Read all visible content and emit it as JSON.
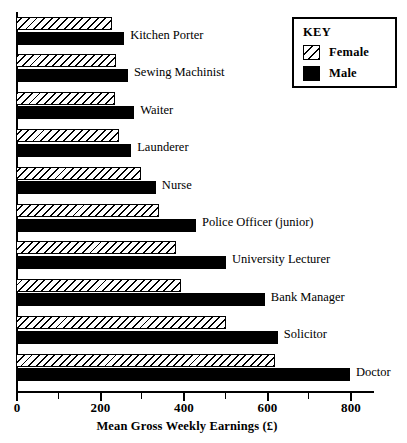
{
  "chart_data": {
    "type": "bar",
    "orientation": "horizontal",
    "title": "",
    "xlabel": "Mean Gross Weekly Earnings (£)",
    "ylabel": "",
    "xlim": [
      0,
      860
    ],
    "xticks": [
      0,
      200,
      400,
      600,
      800
    ],
    "xtick_labels": [
      "0",
      "200",
      "400",
      "600",
      "800"
    ],
    "minor_ticks": [
      100,
      300,
      500,
      700
    ],
    "grid": false,
    "legend_position": "top-right",
    "legend_title": "KEY",
    "categories": [
      "Kitchen Porter",
      "Sewing Machinist",
      "Waiter",
      "Launderer",
      "Nurse",
      "Police Officer (junior)",
      "University Lecturer",
      "Bank Manager",
      "Solicitor",
      "Doctor"
    ],
    "series": [
      {
        "name": "Female",
        "fill": "diagonal-hatch",
        "values": [
          230,
          240,
          237,
          247,
          300,
          343,
          383,
          395,
          503,
          620
        ]
      },
      {
        "name": "Male",
        "fill": "solid-black",
        "values": [
          259,
          268,
          283,
          276,
          335,
          431,
          503,
          596,
          627,
          800
        ]
      }
    ]
  },
  "legend": {
    "title": "KEY",
    "entries": [
      {
        "label": "Female",
        "swatch": "diagonal-hatch-swatch"
      },
      {
        "label": "Male",
        "swatch": "solid-black-swatch"
      }
    ]
  },
  "axis": {
    "x_title": "Mean Gross Weekly Earnings (£)",
    "tick_labels": [
      "0",
      "200",
      "400",
      "600",
      "800"
    ]
  },
  "colors": {
    "ink": "#000000",
    "paper": "#ffffff"
  }
}
